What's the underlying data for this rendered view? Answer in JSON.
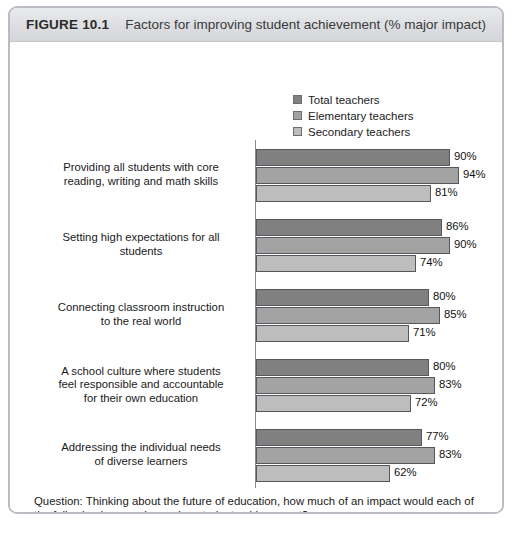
{
  "figure": {
    "number": "FIGURE 10.1",
    "title": "Factors for improving student achievement (% major impact)"
  },
  "footer": {
    "question": "Question: Thinking about the future of education, how much of an impact would each of the following have on improving student achievement?",
    "base": "Base: Teachers (n = 1,003)"
  },
  "colors": {
    "series_total": "#808080",
    "series_elementary": "#a3a3a3",
    "series_secondary": "#bdbdbd",
    "frame": "#b9bcc2",
    "header_bg": "#dcdee1",
    "axis": "#8a8a8a"
  },
  "chart_data": {
    "type": "bar",
    "orientation": "horizontal",
    "title": "Factors for improving student achievement (% major impact)",
    "xlabel": "",
    "ylabel": "",
    "xlim": [
      0,
      100
    ],
    "grid": false,
    "legend_position": "top-right",
    "value_suffix": "%",
    "categories": [
      "Providing all students with core reading, writing and math skills",
      "Setting high expectations for all students",
      "Connecting classroom instruction to the real world",
      "A school culture where students feel responsible and accountable for their own education",
      "Addressing the individual needs of diverse learners"
    ],
    "category_lines": [
      [
        "Providing all students with core",
        "reading, writing and math skills"
      ],
      [
        "Setting high expectations for all",
        "students"
      ],
      [
        "Connecting classroom instruction",
        "to the real world"
      ],
      [
        "A school culture where students",
        "feel responsible and accountable",
        "for their own education"
      ],
      [
        "Addressing the individual needs",
        "of diverse learners"
      ]
    ],
    "series": [
      {
        "name": "Total teachers",
        "color": "#808080",
        "values": [
          90,
          86,
          80,
          80,
          77
        ]
      },
      {
        "name": "Elementary teachers",
        "color": "#a3a3a3",
        "values": [
          94,
          90,
          85,
          83,
          83
        ]
      },
      {
        "name": "Secondary teachers",
        "color": "#bdbdbd",
        "values": [
          71,
          74,
          71,
          72,
          62
        ]
      }
    ],
    "labels": [
      [
        "90%",
        "94%",
        "81%"
      ],
      [
        "86%",
        "90%",
        "74%"
      ],
      [
        "80%",
        "85%",
        "71%"
      ],
      [
        "80%",
        "83%",
        "72%"
      ],
      [
        "77%",
        "83%",
        "62%"
      ]
    ],
    "values_table": [
      {
        "category": "Providing all students with core reading, writing and math skills",
        "total": 90,
        "elementary": 94,
        "secondary": 81
      },
      {
        "category": "Setting high expectations for all students",
        "total": 86,
        "elementary": 90,
        "secondary": 74
      },
      {
        "category": "Connecting classroom instruction to the real world",
        "total": 80,
        "elementary": 85,
        "secondary": 71
      },
      {
        "category": "A school culture where students feel responsible and accountable for their own education",
        "total": 80,
        "elementary": 83,
        "secondary": 72
      },
      {
        "category": "Addressing the individual needs of diverse learners",
        "total": 77,
        "elementary": 83,
        "secondary": 62
      }
    ]
  }
}
